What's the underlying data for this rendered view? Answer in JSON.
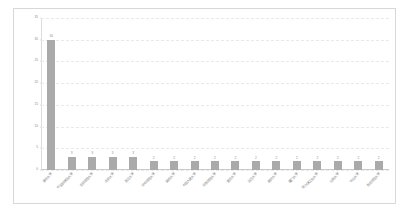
{
  "chart_data": {
    "type": "bar",
    "title": "",
    "subtitle": "",
    "xlabel": "",
    "ylabel": "",
    "ylim": [
      0,
      35
    ],
    "yticks": [
      0,
      5,
      10,
      15,
      20,
      25,
      30,
      35
    ],
    "ytick_labels": [
      "0",
      "5",
      "10",
      "15",
      "20",
      "25",
      "30",
      "35"
    ],
    "grid": true,
    "grid_style": "dashed-horizontal",
    "legend": false,
    "legend_position": "none",
    "bar_color": "#aaaaaa",
    "show_value_labels": true,
    "categories": [
      "清华大学",
      "中国科学院大学",
      "北京师范大学",
      "北京大学",
      "浙江大学",
      "华中师范大学",
      "南京大学",
      "中国人民大学",
      "华东师范大学",
      "复旦大学",
      "武汉大学",
      "南开大学",
      "厦门大学",
      "哈尔滨工业大学",
      "山东大学",
      "中山大学",
      "东北师范大学"
    ],
    "values": [
      30,
      3,
      3,
      3,
      3,
      2,
      2,
      2,
      2,
      2,
      2,
      2,
      2,
      2,
      2,
      2,
      2
    ],
    "value_labels": [
      "30",
      "3",
      "3",
      "3",
      "3",
      "2",
      "2",
      "2",
      "2",
      "2",
      "2",
      "2",
      "2",
      "2",
      "2",
      "2",
      "2"
    ]
  }
}
